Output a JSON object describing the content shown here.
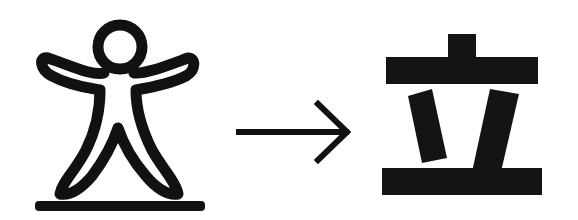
{
  "diagram": {
    "source": {
      "label": "Pictograph of a person standing on the ground",
      "icon": "standing-person-pictograph-icon",
      "stroke_color": "#111111"
    },
    "transition": {
      "icon": "right-arrow-icon",
      "symbol": "→"
    },
    "target": {
      "character": "立",
      "label": "Modern character 立",
      "icon": "li-character-glyph-icon",
      "fill_color": "#111111"
    },
    "background": "#ffffff"
  }
}
